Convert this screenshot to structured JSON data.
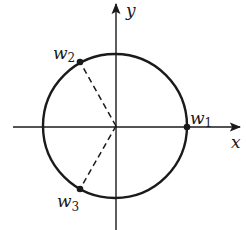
{
  "diagram": {
    "type": "unit-circle-roots",
    "axes": {
      "x_label": "x",
      "y_label": "y"
    },
    "circle": {
      "center": [
        115,
        126
      ],
      "radius": 72
    },
    "points": [
      {
        "id": "w1",
        "label": "w",
        "subscript": "1",
        "angle_deg": 0
      },
      {
        "id": "w2",
        "label": "w",
        "subscript": "2",
        "angle_deg": 120
      },
      {
        "id": "w3",
        "label": "w",
        "subscript": "3",
        "angle_deg": 240
      }
    ],
    "dashed_segments": [
      "origin-to-w2",
      "origin-to-w3"
    ],
    "colors": {
      "ink": "#1a1a1a",
      "background": "#ffffff"
    }
  }
}
